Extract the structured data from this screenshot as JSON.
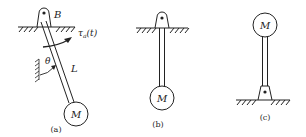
{
  "figures": [
    {
      "id": "a",
      "caption": "(a)",
      "labels": {
        "pivot": "B",
        "torque": "τ",
        "torque_sub": "a",
        "torque_arg": "(t)",
        "angle": "θ",
        "length": "L",
        "mass": "M"
      }
    },
    {
      "id": "b",
      "caption": "(b)",
      "labels": {
        "mass": "M"
      }
    },
    {
      "id": "c",
      "caption": "(c)",
      "labels": {
        "mass": "M"
      }
    }
  ],
  "colors": {
    "ink": "#222222",
    "background": "#ffffff"
  }
}
